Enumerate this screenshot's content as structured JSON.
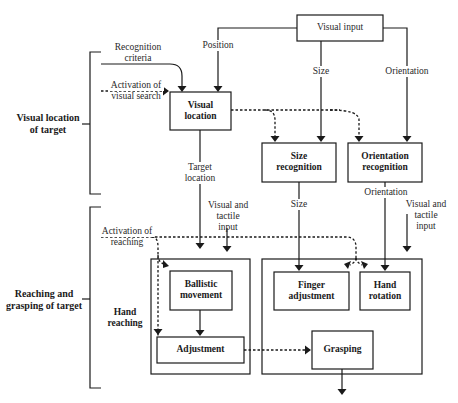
{
  "diagram": {
    "sections": {
      "visual_location": "Visual location of target",
      "visual_location_l1": "Visual location",
      "visual_location_l2": "of target",
      "reaching_l1": "Reaching and",
      "reaching_l2": "grasping of target"
    },
    "boxes": {
      "visual_input": "Visual input",
      "visual_location_l1": "Visual",
      "visual_location_l2": "location",
      "size_recognition_l1": "Size",
      "size_recognition_l2": "recognition",
      "orientation_recognition_l1": "Orientation",
      "orientation_recognition_l2": "recognition",
      "ballistic_l1": "Ballistic",
      "ballistic_l2": "movement",
      "adjustment": "Adjustment",
      "finger_l1": "Finger",
      "finger_l2": "adjustment",
      "hand_rotation_l1": "Hand",
      "hand_rotation_l2": "rotation",
      "grasping": "Grasping"
    },
    "group_labels": {
      "hand_reaching_l1": "Hand",
      "hand_reaching_l2": "reaching"
    },
    "edge_labels": {
      "position": "Position",
      "size_top": "Size",
      "orientation_top": "Orientation",
      "recognition_criteria_l1": "Recognition",
      "recognition_criteria_l2": "criteria",
      "activation_visual_search_l1": "Activation of",
      "activation_visual_search_l2": "visual search",
      "target_location_l1": "Target",
      "target_location_l2": "location",
      "visual_tactile_left_l1": "Visual and",
      "visual_tactile_left_l2": "tactile",
      "visual_tactile_left_l3": "input",
      "size_bottom": "Size",
      "orientation_bottom": "Orientation",
      "visual_tactile_right_l1": "Visual and",
      "visual_tactile_right_l2": "tactile",
      "visual_tactile_right_l3": "input",
      "activation_reaching_l1": "Activation of",
      "activation_reaching_l2": "reaching"
    }
  }
}
